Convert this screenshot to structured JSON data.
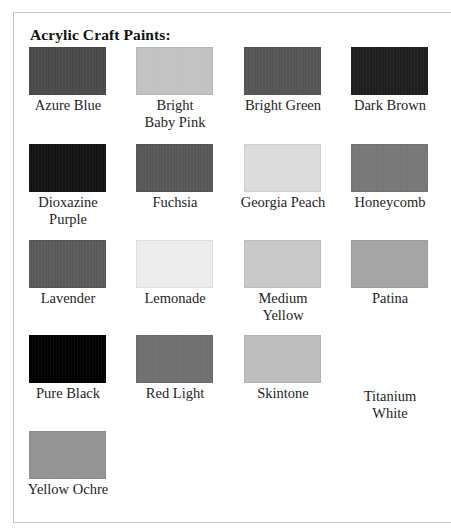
{
  "heading": "Acrylic Craft Paints:",
  "paints": [
    {
      "name": "Azure Blue",
      "line1": "Azure Blue",
      "line2": "",
      "swatch_color": "#4a4a4a"
    },
    {
      "name": "Bright Baby Pink",
      "line1": "Bright",
      "line2": "Baby Pink",
      "swatch_color": "#c2c2c2"
    },
    {
      "name": "Bright Green",
      "line1": "Bright Green",
      "line2": "",
      "swatch_color": "#555555"
    },
    {
      "name": "Dark Brown",
      "line1": "Dark Brown",
      "line2": "",
      "swatch_color": "#1f1f1f"
    },
    {
      "name": "Dioxazine Purple",
      "line1": "Dioxazine",
      "line2": "Purple",
      "swatch_color": "#141414"
    },
    {
      "name": "Fuchsia",
      "line1": "Fuchsia",
      "line2": "",
      "swatch_color": "#575757"
    },
    {
      "name": "Georgia Peach",
      "line1": "Georgia Peach",
      "line2": "",
      "swatch_color": "#dcdcdc"
    },
    {
      "name": "Honeycomb",
      "line1": "Honeycomb",
      "line2": "",
      "swatch_color": "#777777"
    },
    {
      "name": "Lavender",
      "line1": "Lavender",
      "line2": "",
      "swatch_color": "#5a5a5a"
    },
    {
      "name": "Lemonade",
      "line1": "Lemonade",
      "line2": "",
      "swatch_color": "#ececec"
    },
    {
      "name": "Medium Yellow",
      "line1": "Medium",
      "line2": "Yellow",
      "swatch_color": "#c8c8c8"
    },
    {
      "name": "Patina",
      "line1": "Patina",
      "line2": "",
      "swatch_color": "#a4a4a4"
    },
    {
      "name": "Pure Black",
      "line1": "Pure Black",
      "line2": "",
      "swatch_color": "#000000"
    },
    {
      "name": "Red Light",
      "line1": "Red Light",
      "line2": "",
      "swatch_color": "#6f6f6f"
    },
    {
      "name": "Skintone",
      "line1": "Skintone",
      "line2": "",
      "swatch_color": "#bdbdbd"
    },
    {
      "name": "Titanium White",
      "line1": "Titanium",
      "line2": "White",
      "swatch_color": "#ffffff"
    },
    {
      "name": "Yellow Ochre",
      "line1": "Yellow Ochre",
      "line2": "",
      "swatch_color": "#939393"
    }
  ]
}
